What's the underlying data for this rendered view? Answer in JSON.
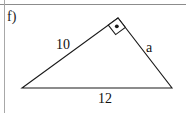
{
  "figure": {
    "part_label": "f)",
    "type": "right-triangle",
    "stroke_color": "#1a1a1a",
    "rule_color": "#8c8c8c",
    "background": "#ffffff",
    "vertices": {
      "left": {
        "x": 22,
        "y": 88
      },
      "apex": {
        "x": 118,
        "y": 18
      },
      "right": {
        "x": 172,
        "y": 88
      }
    },
    "right_angle": {
      "at": "apex",
      "marker": "square-with-center-dot",
      "size": 12
    },
    "labels": {
      "left_side": "10",
      "right_side": "a",
      "base": "12"
    }
  }
}
